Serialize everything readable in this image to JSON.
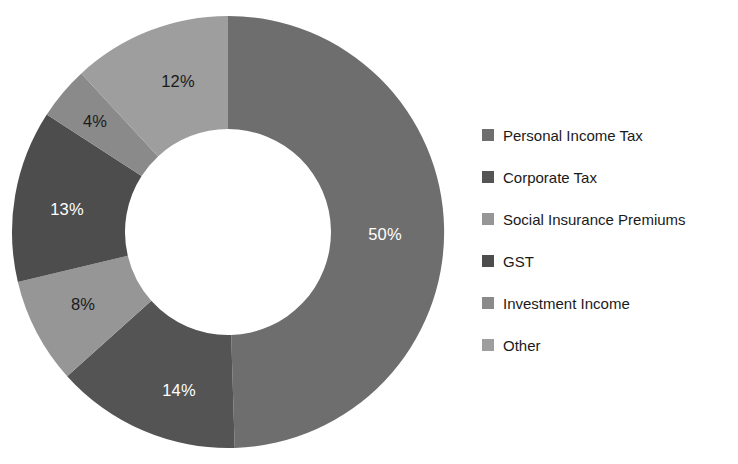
{
  "chart_data": {
    "type": "pie",
    "variant": "donut",
    "title": "",
    "subtitle": "",
    "xlabel": "",
    "ylabel": "",
    "grid": false,
    "legend_position": "right",
    "start_angle_deg": 0,
    "direction": "clockwise",
    "inner_radius_ratio": 0.5,
    "units": "percent",
    "total": 101,
    "categories": [
      "Personal Income Tax",
      "Corporate Tax",
      "Social Insurance Premiums",
      "GST",
      "Investment Income",
      "Other"
    ],
    "values": [
      50,
      14,
      8,
      13,
      4,
      12
    ],
    "data_labels": [
      "50%",
      "14%",
      "8%",
      "13%",
      "4%",
      "12%"
    ],
    "colors": [
      "#6e6e6e",
      "#545454",
      "#969696",
      "#4d4d4d",
      "#8a8a8a",
      "#9e9e9e"
    ],
    "label_text_colors": [
      "#ffffff",
      "#ffffff",
      "#1a1a1a",
      "#ffffff",
      "#1a1a1a",
      "#1a1a1a"
    ],
    "background_color": "#ffffff",
    "slices": [
      {
        "name": "Personal Income Tax",
        "value": 50,
        "label": "50%",
        "color": "#6e6e6e",
        "label_color": "#ffffff",
        "label_x": 385,
        "label_y": 236
      },
      {
        "name": "Corporate Tax",
        "value": 14,
        "label": "14%",
        "color": "#545454",
        "label_color": "#ffffff",
        "label_x": 179,
        "label_y": 392
      },
      {
        "name": "Social Insurance Premiums",
        "value": 8,
        "label": "8%",
        "color": "#969696",
        "label_color": "#1a1a1a",
        "label_x": 83,
        "label_y": 306
      },
      {
        "name": "GST",
        "value": 13,
        "label": "13%",
        "color": "#4d4d4d",
        "label_color": "#ffffff",
        "label_x": 67,
        "label_y": 211
      },
      {
        "name": "Investment Income",
        "value": 4,
        "label": "4%",
        "color": "#8a8a8a",
        "label_color": "#1a1a1a",
        "label_x": 95,
        "label_y": 123
      },
      {
        "name": "Other",
        "value": 12,
        "label": "12%",
        "color": "#9e9e9e",
        "label_color": "#1a1a1a",
        "label_x": 178,
        "label_y": 83
      }
    ],
    "geometry": {
      "center_x": 228,
      "center_y": 232,
      "outer_radius": 216,
      "inner_radius": 103
    }
  },
  "legend": {
    "items": [
      {
        "label": "Personal Income Tax",
        "color": "#6e6e6e"
      },
      {
        "label": "Corporate Tax",
        "color": "#545454"
      },
      {
        "label": "Social Insurance Premiums",
        "color": "#969696"
      },
      {
        "label": "GST",
        "color": "#4d4d4d"
      },
      {
        "label": "Investment Income",
        "color": "#8a8a8a"
      },
      {
        "label": "Other",
        "color": "#9e9e9e"
      }
    ]
  }
}
